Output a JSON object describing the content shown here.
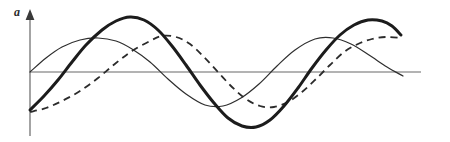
{
  "figure": {
    "title": "",
    "vertical_axis_label": "a",
    "background_color": "#ffffff"
  },
  "axes": {
    "vertical": {
      "name": "amplitude-axis",
      "color": "#8d8d8d",
      "x": 30,
      "y_top": 12,
      "y_bottom": 136,
      "stroke_width": 1.6,
      "arrow_head": true,
      "arrow_color": "#3a3a3a"
    },
    "horizontal": {
      "name": "time-axis",
      "color": "#9a9a9a",
      "y": 72,
      "x_start": 30,
      "x_end": 421,
      "stroke_width": 1.6,
      "arrow_head": false
    },
    "grid": false
  },
  "chart_data": {
    "type": "line",
    "title": "",
    "xlabel": "",
    "ylabel": "a",
    "xlim": [
      0,
      450
    ],
    "ylim": [
      -70,
      60
    ],
    "grid": false,
    "legend": "none",
    "baseline_y_px": 72,
    "period_px": 185,
    "series": [
      {
        "name": "thin-wave",
        "style": "solid",
        "stroke_width": 1.2,
        "color": "#2e2e2e",
        "amplitude_px": 34,
        "phase_deg": 0,
        "x_start_px": 30,
        "x_end_px": 403,
        "points": [
          [
            30,
            72
          ],
          [
            46,
            58
          ],
          [
            62,
            47
          ],
          [
            80,
            40
          ],
          [
            98,
            38
          ],
          [
            116,
            41
          ],
          [
            132,
            49
          ],
          [
            150,
            62
          ],
          [
            168,
            79
          ],
          [
            186,
            94
          ],
          [
            205,
            105
          ],
          [
            223,
            106
          ],
          [
            241,
            98
          ],
          [
            259,
            84
          ],
          [
            277,
            66
          ],
          [
            295,
            50
          ],
          [
            315,
            39
          ],
          [
            333,
            38
          ],
          [
            351,
            44
          ],
          [
            369,
            55
          ],
          [
            387,
            67
          ],
          [
            403,
            76
          ]
        ],
        "extrema": [
          {
            "type": "peak",
            "x": 98,
            "y": 38
          },
          {
            "type": "trough",
            "x": 205,
            "y": 106
          },
          {
            "type": "peak",
            "x": 315,
            "y": 38
          }
        ]
      },
      {
        "name": "bold-wave",
        "style": "solid",
        "stroke_width": 3.0,
        "color": "#1c1c1c",
        "amplitude_px": 55,
        "phase_deg": 250,
        "x_start_px": 30,
        "x_end_px": 401,
        "points": [
          [
            30,
            110
          ],
          [
            44,
            96
          ],
          [
            58,
            80
          ],
          [
            72,
            62
          ],
          [
            86,
            45
          ],
          [
            102,
            30
          ],
          [
            116,
            21
          ],
          [
            130,
            17
          ],
          [
            144,
            20
          ],
          [
            158,
            30
          ],
          [
            172,
            46
          ],
          [
            186,
            65
          ],
          [
            200,
            85
          ],
          [
            214,
            103
          ],
          [
            228,
            118
          ],
          [
            242,
            126
          ],
          [
            256,
            127
          ],
          [
            270,
            120
          ],
          [
            284,
            106
          ],
          [
            298,
            88
          ],
          [
            312,
            68
          ],
          [
            326,
            50
          ],
          [
            340,
            35
          ],
          [
            354,
            25
          ],
          [
            368,
            20
          ],
          [
            382,
            21
          ],
          [
            392,
            26
          ],
          [
            401,
            35
          ]
        ],
        "extrema": [
          {
            "type": "peak",
            "x": 131,
            "y": 17
          },
          {
            "type": "trough",
            "x": 248,
            "y": 127
          },
          {
            "type": "peak",
            "x": 377,
            "y": 20
          }
        ]
      },
      {
        "name": "dashed-wave",
        "style": "dashed",
        "dash_pattern": "7,5",
        "stroke_width": 1.8,
        "color": "#2b2b2b",
        "amplitude_px": 38,
        "phase_deg": 205,
        "x_start_px": 30,
        "x_end_px": 401,
        "points": [
          [
            30,
            112
          ],
          [
            46,
            108
          ],
          [
            62,
            101
          ],
          [
            80,
            91
          ],
          [
            98,
            78
          ],
          [
            116,
            63
          ],
          [
            132,
            51
          ],
          [
            150,
            41
          ],
          [
            162,
            36
          ],
          [
            176,
            37
          ],
          [
            190,
            44
          ],
          [
            204,
            57
          ],
          [
            218,
            72
          ],
          [
            232,
            87
          ],
          [
            246,
            99
          ],
          [
            260,
            106
          ],
          [
            274,
            107
          ],
          [
            288,
            102
          ],
          [
            302,
            92
          ],
          [
            316,
            79
          ],
          [
            330,
            65
          ],
          [
            344,
            52
          ],
          [
            358,
            44
          ],
          [
            372,
            39
          ],
          [
            386,
            37
          ],
          [
            401,
            38
          ]
        ],
        "extrema": [
          {
            "type": "peak",
            "x": 168,
            "y": 36
          },
          {
            "type": "trough",
            "x": 266,
            "y": 107
          },
          {
            "type": "peak",
            "x": 394,
            "y": 37
          }
        ]
      }
    ]
  }
}
